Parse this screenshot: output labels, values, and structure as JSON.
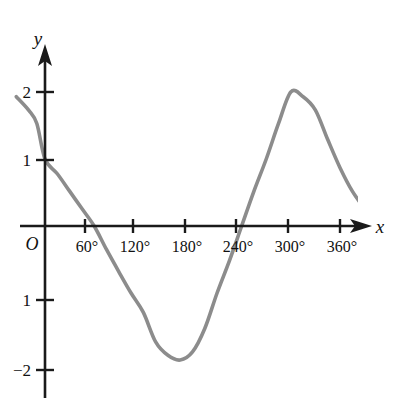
{
  "figure": {
    "background_color": "#ffffff",
    "axis_color": "#1a1a1a",
    "curve_color": "#8c8c8c"
  },
  "labels": {
    "x_axis_name": "x",
    "y_axis_name": "y",
    "origin": "O"
  },
  "axis_x": {
    "tick_labels": [
      "60°",
      "120°",
      "180°",
      "240°",
      "300°",
      "360°"
    ],
    "tick_values": [
      60,
      120,
      180,
      240,
      300,
      360
    ],
    "tick_pixels": [
      85,
      133,
      185,
      236,
      288,
      340
    ]
  },
  "axis_y": {
    "tick_labels": [
      "2",
      "1",
      "1",
      "−2"
    ],
    "tick_values": [
      2,
      1,
      -1,
      -2
    ],
    "tick_pixels": [
      92,
      160,
      300,
      370
    ]
  },
  "chart_data": {
    "type": "line",
    "title": "",
    "subtitle": "",
    "xlabel": "x",
    "ylabel": "y",
    "grid": false,
    "legend": null,
    "xlim": [
      -25,
      395
    ],
    "ylim": [
      -2.4,
      2.4
    ],
    "xticks": [
      60,
      120,
      180,
      240,
      300,
      360
    ],
    "xticklabels": [
      "60°",
      "120°",
      "180°",
      "240°",
      "300°",
      "360°"
    ],
    "yticks": [
      -2,
      -1,
      1,
      2
    ],
    "yticklabels": [
      "−2",
      "1",
      "1",
      "2"
    ],
    "series": [
      {
        "name": "y = 2 sin(x + 210°)",
        "color": "#8c8c8c",
        "x": [
          -35,
          -20,
          -10,
          0,
          15,
          30,
          45,
          60,
          75,
          90,
          105,
          120,
          135,
          150,
          165,
          180,
          195,
          210,
          225,
          240,
          255,
          270,
          285,
          300,
          315,
          330,
          345,
          360,
          375,
          390
        ],
        "y": [
          1.93,
          1.73,
          1.53,
          1.0,
          0.78,
          0.52,
          0.26,
          0.0,
          -0.35,
          -0.68,
          -1.0,
          -1.29,
          -1.73,
          -1.93,
          -2.0,
          -1.88,
          -1.53,
          -1.0,
          -0.52,
          0.0,
          0.52,
          1.0,
          1.53,
          2.0,
          1.93,
          1.73,
          1.29,
          0.87,
          0.52,
          0.26
        ]
      }
    ],
    "annotations": [
      {
        "text": "y-intercept",
        "x": 0,
        "y": 1
      },
      {
        "text": "minimum",
        "x": 165,
        "y": -2
      },
      {
        "text": "maximum",
        "x": 300,
        "y": 2
      }
    ]
  }
}
